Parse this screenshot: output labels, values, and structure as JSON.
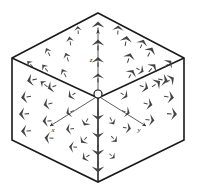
{
  "figure": {
    "background_color": "#ffffff",
    "outline_color": "#1a1a1a",
    "arrow_color": "#444444",
    "axis_color": "#333333"
  },
  "cube": {
    "name": "isometric-cube",
    "vertices": {
      "top": [
        98,
        13
      ],
      "upper_left": [
        12,
        58
      ],
      "upper_right": [
        184,
        58
      ],
      "center": [
        98,
        98
      ],
      "lower_left": [
        12,
        140
      ],
      "lower_right": [
        184,
        140
      ],
      "bottom": [
        98,
        182
      ]
    },
    "silhouette_path": "M98,13 L184,58 L184,140 L98,182 L12,140 L12,58 Z",
    "internal_edges": [
      "M12,58 L98,98",
      "M184,58 L98,98",
      "M98,98 L98,182"
    ],
    "faces": [
      "top-face",
      "left-face",
      "right-face"
    ]
  },
  "origin": {
    "name": "origin-marker",
    "cx": 98,
    "cy": 94,
    "r": 4,
    "label": ""
  },
  "axes": [
    {
      "id": "x",
      "label": "x",
      "label_x": 53,
      "label_y": 132,
      "line": "M98,96 L50,126",
      "tip": [
        50,
        126
      ]
    },
    {
      "id": "y",
      "label": "y",
      "label_x": 139,
      "label_y": 132,
      "line": "M98,96 L146,126",
      "tip": [
        146,
        126
      ]
    },
    {
      "id": "z",
      "label": "z",
      "label_x": 91,
      "label_y": 62,
      "line": "M98,96 L98,30",
      "tip": [
        98,
        30
      ]
    }
  ],
  "chart_data": {
    "type": "scatter",
    "xlabel": "x",
    "ylabel": "y",
    "zlabel": "z",
    "legend": [],
    "grid": false,
    "note": "Each datum is a field vector sample drawn as an arrow; angle is the projected direction, length is the projected magnitude.",
    "vectors": [
      {
        "x": 98,
        "y": 27,
        "angle": -90,
        "len": 11,
        "w": 3.2
      },
      {
        "x": 98,
        "y": 45,
        "angle": -90,
        "len": 11,
        "w": 3.2
      },
      {
        "x": 98,
        "y": 62,
        "angle": -90,
        "len": 10,
        "w": 3.0
      },
      {
        "x": 98,
        "y": 78,
        "angle": -90,
        "len": 9,
        "w": 3.0
      },
      {
        "x": 98,
        "y": 115,
        "angle": 90,
        "len": 10,
        "w": 3.0
      },
      {
        "x": 98,
        "y": 133,
        "angle": 90,
        "len": 10,
        "w": 3.0
      },
      {
        "x": 98,
        "y": 150,
        "angle": 90,
        "len": 11,
        "w": 3.2
      },
      {
        "x": 98,
        "y": 167,
        "angle": 90,
        "len": 11,
        "w": 3.2
      },
      {
        "x": 126,
        "y": 41,
        "angle": -80,
        "len": 10,
        "w": 3.0
      },
      {
        "x": 129,
        "y": 58,
        "angle": -72,
        "len": 10,
        "w": 3.0
      },
      {
        "x": 131,
        "y": 74,
        "angle": -60,
        "len": 9,
        "w": 3.0
      },
      {
        "x": 150,
        "y": 52,
        "angle": -62,
        "len": 10,
        "w": 3.0
      },
      {
        "x": 152,
        "y": 68,
        "angle": -50,
        "len": 10,
        "w": 3.0
      },
      {
        "x": 156,
        "y": 84,
        "angle": -36,
        "len": 10,
        "w": 3.0
      },
      {
        "x": 168,
        "y": 64,
        "angle": -44,
        "len": 9,
        "w": 3.0
      },
      {
        "x": 170,
        "y": 80,
        "angle": -30,
        "len": 9,
        "w": 3.0
      },
      {
        "x": 118,
        "y": 30,
        "angle": -86,
        "len": 9,
        "w": 2.8
      },
      {
        "x": 142,
        "y": 44,
        "angle": -68,
        "len": 9,
        "w": 2.8
      },
      {
        "x": 70,
        "y": 41,
        "angle": -100,
        "len": 9,
        "w": 1.6
      },
      {
        "x": 67,
        "y": 57,
        "angle": -108,
        "len": 9,
        "w": 1.6
      },
      {
        "x": 64,
        "y": 73,
        "angle": -118,
        "len": 9,
        "w": 1.6
      },
      {
        "x": 48,
        "y": 52,
        "angle": -116,
        "len": 9,
        "w": 1.5
      },
      {
        "x": 45,
        "y": 68,
        "angle": -128,
        "len": 9,
        "w": 1.5
      },
      {
        "x": 44,
        "y": 84,
        "angle": -142,
        "len": 9,
        "w": 1.5
      },
      {
        "x": 30,
        "y": 64,
        "angle": -134,
        "len": 8,
        "w": 1.4
      },
      {
        "x": 78,
        "y": 30,
        "angle": -94,
        "len": 8,
        "w": 1.5
      },
      {
        "x": 32,
        "y": 80,
        "angle": 168,
        "len": 10,
        "w": 3.2
      },
      {
        "x": 26,
        "y": 97,
        "angle": 172,
        "len": 10,
        "w": 3.2
      },
      {
        "x": 24,
        "y": 114,
        "angle": 176,
        "len": 10,
        "w": 3.2
      },
      {
        "x": 26,
        "y": 131,
        "angle": 178,
        "len": 10,
        "w": 3.2
      },
      {
        "x": 52,
        "y": 87,
        "angle": 160,
        "len": 9,
        "w": 3.0
      },
      {
        "x": 48,
        "y": 104,
        "angle": 168,
        "len": 9,
        "w": 3.0
      },
      {
        "x": 47,
        "y": 121,
        "angle": 176,
        "len": 9,
        "w": 3.0
      },
      {
        "x": 49,
        "y": 138,
        "angle": 184,
        "len": 9,
        "w": 3.0
      },
      {
        "x": 72,
        "y": 95,
        "angle": 150,
        "len": 8,
        "w": 2.8
      },
      {
        "x": 70,
        "y": 112,
        "angle": 160,
        "len": 8,
        "w": 2.8
      },
      {
        "x": 70,
        "y": 129,
        "angle": 172,
        "len": 8,
        "w": 2.8
      },
      {
        "x": 73,
        "y": 147,
        "angle": 184,
        "len": 8,
        "w": 2.8
      },
      {
        "x": 86,
        "y": 122,
        "angle": 120,
        "len": 8,
        "w": 2.6
      },
      {
        "x": 84,
        "y": 140,
        "angle": 135,
        "len": 8,
        "w": 2.6
      },
      {
        "x": 86,
        "y": 157,
        "angle": 150,
        "len": 8,
        "w": 2.6
      },
      {
        "x": 163,
        "y": 80,
        "angle": 12,
        "len": 10,
        "w": 3.2
      },
      {
        "x": 169,
        "y": 97,
        "angle": 8,
        "len": 10,
        "w": 3.2
      },
      {
        "x": 172,
        "y": 114,
        "angle": 4,
        "len": 10,
        "w": 3.2
      },
      {
        "x": 144,
        "y": 87,
        "angle": 20,
        "len": 9,
        "w": 3.0
      },
      {
        "x": 148,
        "y": 104,
        "angle": 12,
        "len": 9,
        "w": 3.0
      },
      {
        "x": 150,
        "y": 120,
        "angle": 6,
        "len": 9,
        "w": 3.0
      },
      {
        "x": 124,
        "y": 95,
        "angle": 32,
        "len": 8,
        "w": 2.8
      },
      {
        "x": 126,
        "y": 112,
        "angle": 20,
        "len": 8,
        "w": 2.8
      },
      {
        "x": 127,
        "y": 128,
        "angle": 10,
        "len": 8,
        "w": 2.8
      },
      {
        "x": 112,
        "y": 121,
        "angle": 58,
        "len": 8,
        "w": 1.8
      },
      {
        "x": 114,
        "y": 139,
        "angle": 46,
        "len": 8,
        "w": 1.8
      },
      {
        "x": 112,
        "y": 156,
        "angle": 40,
        "len": 7,
        "w": 1.8
      },
      {
        "x": 140,
        "y": 70,
        "angle": 26,
        "len": 8,
        "w": 2.6
      }
    ]
  }
}
